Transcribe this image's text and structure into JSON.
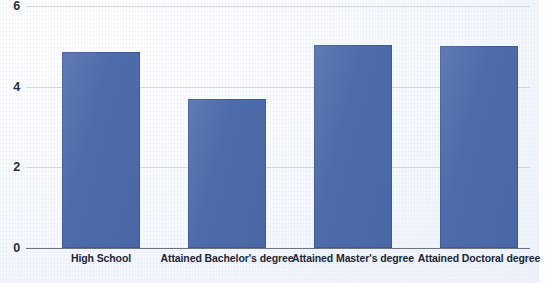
{
  "chart_data": {
    "type": "bar",
    "title": "",
    "subtitle": "",
    "xlabel": "",
    "ylabel": "",
    "categories": [
      "High School",
      "Attained Bachelor's degree",
      "Attained Master's degree",
      "Attained Doctoral degree"
    ],
    "values": [
      4.86,
      3.69,
      5.03,
      5.01
    ],
    "ylim": [
      0,
      6
    ],
    "yticks": [
      0,
      2,
      4,
      6
    ],
    "ytick_labels": [
      "0",
      "2",
      "4",
      "6"
    ],
    "grid": true,
    "legend": false,
    "legend_position": "none",
    "bar_color": "#4e6cab",
    "gridline_color": "#c8d2e0",
    "axis_color": "#6d7480",
    "background_color": "#f6f9fd",
    "label_color": "#1e2635",
    "annotations": []
  },
  "axis": {
    "y_ticks": [
      {
        "label": "6",
        "value": 6
      },
      {
        "label": "4",
        "value": 4
      },
      {
        "label": "2",
        "value": 2
      },
      {
        "label": "0",
        "value": 0
      }
    ]
  },
  "bars": [
    {
      "label": "High School",
      "value": 4.86
    },
    {
      "label": "Attained Bachelor's degree",
      "value": 3.69
    },
    {
      "label": "Attained Master's degree",
      "value": 5.03
    },
    {
      "label": "Attained Doctoral degree",
      "value": 5.01
    }
  ]
}
